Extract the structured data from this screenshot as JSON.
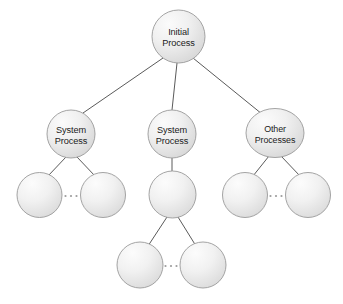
{
  "diagram": {
    "type": "tree",
    "colors": {
      "node_fill_light": "#f7f7f7",
      "node_fill_dark": "#d9d9d9",
      "node_stroke": "#9a9a9a",
      "edge_stroke": "#5a5a5a",
      "label_text": "#1b1b1b",
      "background": "#ffffff",
      "ellipsis_dot": "#9c9c9c"
    },
    "nodes": [
      {
        "id": "root",
        "label_lines": [
          "Initial",
          "Process"
        ],
        "line1": "Initial",
        "line2": "Process",
        "cx": 178.5,
        "cy": 36.5,
        "rx": 26.5,
        "ry": 26.5,
        "level": 0,
        "labeled": true
      },
      {
        "id": "sys-left",
        "label_lines": [
          "System",
          "Process"
        ],
        "line1": "System",
        "line2": "Process",
        "cx": 71,
        "cy": 134,
        "rx": 24,
        "ry": 24,
        "level": 1,
        "labeled": true
      },
      {
        "id": "sys-mid",
        "label_lines": [
          "System",
          "Process"
        ],
        "line1": "System",
        "line2": "Process",
        "cx": 172,
        "cy": 134,
        "rx": 24,
        "ry": 24,
        "level": 1,
        "labeled": true
      },
      {
        "id": "other-right",
        "label_lines": [
          "Other",
          "Processes"
        ],
        "line1": "Other",
        "line2": "Processes",
        "cx": 275,
        "cy": 133,
        "rx": 29,
        "ry": 24.5,
        "level": 1,
        "labeled": true
      },
      {
        "id": "leaf-l1",
        "label_lines": [],
        "cx": 39.5,
        "cy": 195,
        "rx": 22.5,
        "ry": 22.5,
        "level": 2,
        "labeled": false
      },
      {
        "id": "leaf-l2",
        "label_lines": [],
        "cx": 103,
        "cy": 195,
        "rx": 22.5,
        "ry": 22.5,
        "level": 2,
        "labeled": false
      },
      {
        "id": "leaf-m1",
        "label_lines": [],
        "cx": 172.5,
        "cy": 194.5,
        "rx": 23.5,
        "ry": 23.5,
        "level": 2,
        "labeled": false
      },
      {
        "id": "leaf-r1",
        "label_lines": [],
        "cx": 245,
        "cy": 195,
        "rx": 22.5,
        "ry": 22.5,
        "level": 2,
        "labeled": false
      },
      {
        "id": "leaf-r2",
        "label_lines": [],
        "cx": 308,
        "cy": 195,
        "rx": 22.5,
        "ry": 22.5,
        "level": 2,
        "labeled": false
      },
      {
        "id": "leaf-b1",
        "label_lines": [],
        "cx": 140,
        "cy": 265,
        "rx": 23,
        "ry": 23,
        "level": 3,
        "labeled": false
      },
      {
        "id": "leaf-b2",
        "label_lines": [],
        "cx": 203,
        "cy": 265,
        "rx": 23,
        "ry": 23,
        "level": 3,
        "labeled": false
      }
    ],
    "edges": [
      {
        "id": "root-to-sys-left",
        "from": "root",
        "to": "sys-left",
        "x1": 163,
        "y1": 58,
        "x2": 83,
        "y2": 113
      },
      {
        "id": "root-to-sys-mid",
        "from": "root",
        "to": "sys-mid",
        "x1": 177,
        "y1": 63,
        "x2": 172,
        "y2": 110
      },
      {
        "id": "root-to-other",
        "from": "root",
        "to": "other-right",
        "x1": 193,
        "y1": 58,
        "x2": 262,
        "y2": 114
      },
      {
        "id": "sys-left-to-l1",
        "from": "sys-left",
        "to": "leaf-l1",
        "x1": 66,
        "y1": 157,
        "x2": 48,
        "y2": 176
      },
      {
        "id": "sys-left-to-l2",
        "from": "sys-left",
        "to": "leaf-l2",
        "x1": 77,
        "y1": 157,
        "x2": 95,
        "y2": 176
      },
      {
        "id": "sys-mid-to-m1",
        "from": "sys-mid",
        "to": "leaf-m1",
        "x1": 172,
        "y1": 158,
        "x2": 172,
        "y2": 171
      },
      {
        "id": "other-to-r1",
        "from": "other-right",
        "to": "leaf-r1",
        "x1": 269,
        "y1": 156,
        "x2": 253,
        "y2": 176
      },
      {
        "id": "other-to-r2",
        "from": "other-right",
        "to": "leaf-r2",
        "x1": 281,
        "y1": 156,
        "x2": 300,
        "y2": 176
      },
      {
        "id": "m1-to-b1",
        "from": "leaf-m1",
        "to": "leaf-b1",
        "x1": 167,
        "y1": 217,
        "x2": 148,
        "y2": 246
      },
      {
        "id": "m1-to-b2",
        "from": "leaf-m1",
        "to": "leaf-b2",
        "x1": 178,
        "y1": 217,
        "x2": 196,
        "y2": 246
      }
    ],
    "ellipses": [
      {
        "id": "ellipsis-left",
        "text": "...",
        "cx": 71,
        "cy": 196,
        "between": [
          "leaf-l1",
          "leaf-l2"
        ]
      },
      {
        "id": "ellipsis-right",
        "text": "...",
        "cx": 276,
        "cy": 196,
        "between": [
          "leaf-r1",
          "leaf-r2"
        ]
      },
      {
        "id": "ellipsis-bottom",
        "text": "...",
        "cx": 171,
        "cy": 266,
        "between": [
          "leaf-b1",
          "leaf-b2"
        ]
      }
    ]
  }
}
